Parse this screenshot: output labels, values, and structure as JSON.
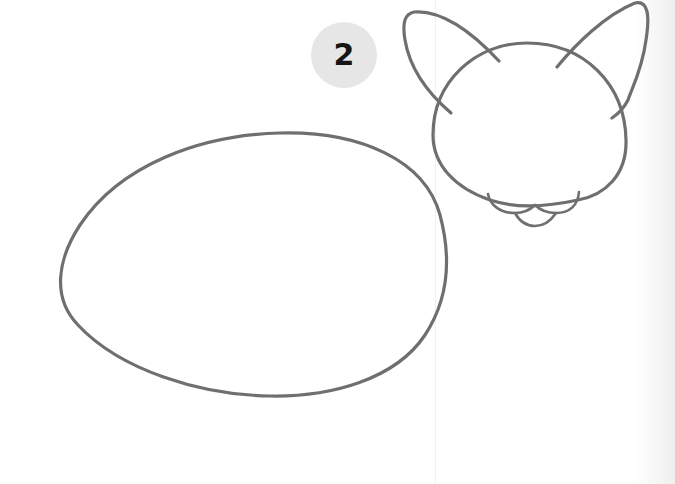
{
  "step": {
    "number": "2",
    "badge_color": "#e6e6e6",
    "number_color": "#151515"
  },
  "drawing": {
    "subject": "cat sketch",
    "stroke_color": "#6f6f6f",
    "shapes": [
      "body-oval",
      "head-circle",
      "left-ear",
      "right-ear",
      "muzzle"
    ]
  }
}
